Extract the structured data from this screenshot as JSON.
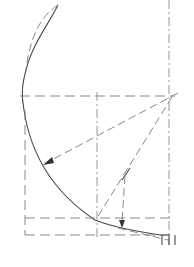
{
  "diagram": {
    "type": "geometric-construction",
    "colors": {
      "curve": "#4a4a4a",
      "construction": "#7a7a7a",
      "arrow": "#333333",
      "background": "#ffffff"
    },
    "labels": []
  }
}
